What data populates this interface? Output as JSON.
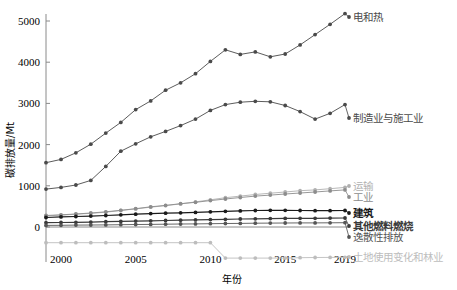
{
  "chart_data": {
    "type": "line",
    "title": "",
    "xlabel": "年份",
    "ylabel": "碳排放量/Mt",
    "xlim": [
      1999,
      2019
    ],
    "ylim": [
      -900,
      5500
    ],
    "xticks": [
      2000,
      2005,
      2010,
      2015,
      2019
    ],
    "yticks": [
      0,
      1000,
      2000,
      3000,
      4000,
      5000
    ],
    "grid": false,
    "legend_position": "inline-right",
    "x": [
      1999,
      2000,
      2001,
      2002,
      2003,
      2004,
      2005,
      2006,
      2007,
      2008,
      2009,
      2010,
      2011,
      2012,
      2013,
      2014,
      2015,
      2016,
      2017,
      2018,
      2019
    ],
    "series": [
      {
        "name": "电和热",
        "color": "#4a4a4a",
        "marker": "circle",
        "values": [
          1560,
          1640,
          1800,
          2010,
          2280,
          2540,
          2850,
          3060,
          3320,
          3500,
          3720,
          4020,
          4300,
          4190,
          4250,
          4130,
          4200,
          4420,
          4670,
          4920,
          5180
        ]
      },
      {
        "name": "制造业与施工业",
        "color": "#4a4a4a",
        "marker": "circle",
        "values": [
          920,
          960,
          1020,
          1130,
          1470,
          1840,
          2020,
          2190,
          2320,
          2460,
          2620,
          2830,
          2970,
          3030,
          3050,
          3040,
          2950,
          2800,
          2620,
          2760,
          2970
        ]
      },
      {
        "name": "运输",
        "color": "#b0b0b0",
        "marker": "circle",
        "values": [
          270,
          290,
          310,
          330,
          360,
          400,
          440,
          480,
          520,
          560,
          610,
          660,
          710,
          750,
          790,
          820,
          850,
          880,
          900,
          930,
          960
        ]
      },
      {
        "name": "工业",
        "color": "#8c8c8c",
        "marker": "circle",
        "values": [
          280,
          295,
          315,
          340,
          370,
          405,
          445,
          490,
          525,
          565,
          600,
          640,
          680,
          715,
          750,
          775,
          800,
          825,
          850,
          875,
          900
        ]
      },
      {
        "name": "建筑",
        "color": "#1a1a1a",
        "marker": "circle",
        "values": [
          230,
          245,
          255,
          265,
          280,
          295,
          310,
          325,
          335,
          345,
          355,
          370,
          380,
          390,
          400,
          405,
          405,
          400,
          395,
          395,
          400
        ]
      },
      {
        "name": "其他燃料燃烧",
        "color": "#3a3a3a",
        "marker": "circle",
        "values": [
          105,
          110,
          115,
          120,
          128,
          135,
          142,
          150,
          158,
          165,
          172,
          180,
          188,
          195,
          200,
          205,
          208,
          210,
          212,
          215,
          218
        ]
      },
      {
        "name": "逸散性排放",
        "color": "#555555",
        "marker": "circle",
        "values": [
          40,
          42,
          45,
          48,
          52,
          56,
          60,
          64,
          68,
          72,
          76,
          80,
          84,
          88,
          92,
          95,
          97,
          99,
          100,
          102,
          104
        ]
      },
      {
        "name": "土地使用变化和林业",
        "color": "#bdbdbd",
        "marker": "circle",
        "values": [
          -380,
          -380,
          -380,
          -380,
          -380,
          -380,
          -380,
          -380,
          -380,
          -380,
          -380,
          -380,
          -755,
          -755,
          -755,
          -755,
          -755,
          -745,
          -740,
          -738,
          -735
        ]
      }
    ]
  }
}
